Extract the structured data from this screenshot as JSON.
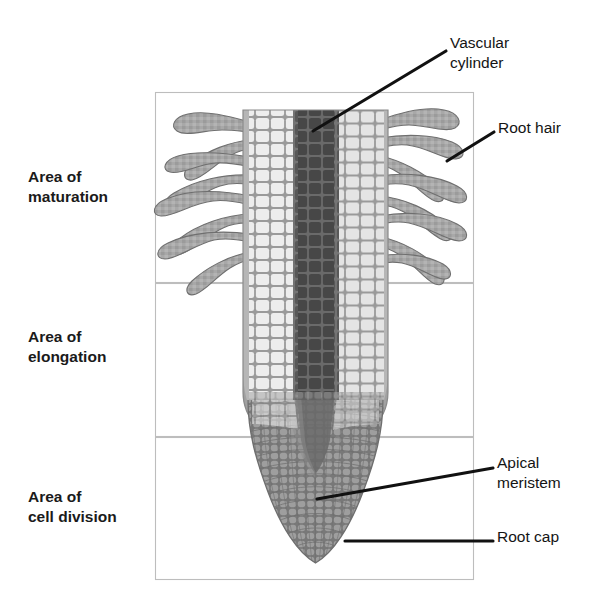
{
  "figure": {
    "zone_labels": [
      {
        "name": "area-of-maturation",
        "text": "Area of\nmaturation"
      },
      {
        "name": "area-of-elongation",
        "text": "Area of\nelongation"
      },
      {
        "name": "area-of-cell-division",
        "text": "Area of\ncell division"
      }
    ],
    "callouts": [
      {
        "name": "vascular-cylinder",
        "text": "Vascular\ncylinder"
      },
      {
        "name": "root-hair",
        "text": "Root hair"
      },
      {
        "name": "apical-meristem",
        "text": "Apical\nmeristem"
      },
      {
        "name": "root-cap",
        "text": "Root cap"
      }
    ],
    "colors": {
      "background": "#ffffff",
      "frame_stroke": "#b9b9b9",
      "leader_line": "#111111",
      "label_text": "#1a1a1a",
      "vascular_cylinder_dark": "#4a4a4a",
      "vascular_cylinder_mid": "#5e5e5e",
      "cortex_cell_light": "#ededed",
      "cortex_mortar": "#9a9a9a",
      "epidermis_gray": "#b2b2b2",
      "root_hair_gray": "#a8a8a8",
      "root_hair_outline": "#6f6f6f",
      "meristem_gray": "#8c8c8c",
      "root_cap_gray": "#9b9b9b"
    }
  },
  "labels": {
    "maturation": "Area of\nmaturation",
    "elongation": "Area of\nelongation",
    "cell_division": "Area of\ncell division",
    "vascular_cylinder": "Vascular\ncylinder",
    "root_hair": "Root hair",
    "apical_meristem": "Apical\nmeristem",
    "root_cap": "Root cap"
  },
  "frames": [
    {
      "name": "frame-maturation",
      "x": 155,
      "y": 92,
      "w": 319,
      "h": 191
    },
    {
      "name": "frame-elongation",
      "x": 155,
      "y": 283,
      "w": 319,
      "h": 154
    },
    {
      "name": "frame-cell-division",
      "x": 155,
      "y": 437,
      "w": 319,
      "h": 143
    }
  ]
}
